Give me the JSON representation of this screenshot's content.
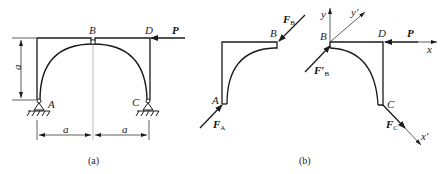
{
  "figure_a": {
    "caption": "(a)",
    "labels": {
      "A": "A",
      "B": "B",
      "C": "C",
      "D": "D",
      "P": "P"
    },
    "dimensions": {
      "vertical": "a",
      "horizontal_left": "a",
      "horizontal_right": "a"
    }
  },
  "figure_b": {
    "caption": "(b)",
    "left_part": {
      "labels": {
        "A": "A",
        "B": "B"
      },
      "forces": {
        "FA": "F",
        "FA_sub": "A",
        "FB": "F",
        "FB_sub": "B"
      }
    },
    "right_part": {
      "labels": {
        "B": "B",
        "C": "C",
        "D": "D",
        "P": "P"
      },
      "axes": {
        "x": "x",
        "y": "y",
        "x_prime": "x′",
        "y_prime": "y′"
      },
      "forces": {
        "FB_prime": "F′",
        "FB_prime_sub": "B",
        "FC": "F",
        "FC_sub": "C"
      }
    }
  },
  "colors": {
    "line": "#1a1a1a",
    "thin": "#555555",
    "background": "#ffffff"
  }
}
